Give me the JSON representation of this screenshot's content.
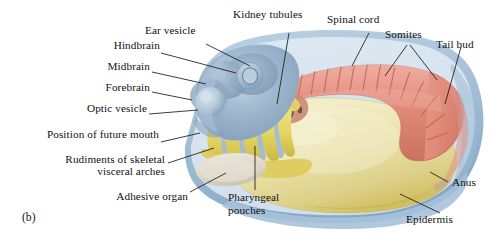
{
  "figure": {
    "panel_label": "(b)",
    "background": "#ffffff"
  },
  "palette": {
    "brain": "#8fa8c0",
    "brain_deep": "#6d8aa6",
    "brain_light": "#bcd0e0",
    "epidermis_rim": "#9dbad4",
    "neural_cord": "#e0897a",
    "neural_cord_dark": "#c4705f",
    "somite_line": "#b9604f",
    "yolk_pale": "#ece4b0",
    "yolk_deep": "#d4c35e",
    "arch_yellow": "#e8d96a",
    "arch_yellow_deep": "#cdb94a",
    "pouch_blue": "#9fb9d2",
    "kidney_brown": "#7a5441",
    "adhesive_organ": "#ddd8cc",
    "leader": "#1a1a1a",
    "text": "#111111"
  },
  "labels": {
    "ear_vesicle": "Ear vesicle",
    "hindbrain": "Hindbrain",
    "midbrain": "Midbrain",
    "forebrain": "Forebrain",
    "optic_vesicle": "Optic vesicle",
    "position_of_future_mouth": "Position of future mouth",
    "rudiments_line1": "Rudiments of skeletal",
    "rudiments_line2": "visceral arches",
    "adhesive_organ": "Adhesive organ",
    "pharyngeal_line1": "Pharyngeal",
    "pharyngeal_line2": "pouches",
    "kidney_tubules": "Kidney tubules",
    "spinal_cord": "Spinal cord",
    "somites": "Somites",
    "tail_bud": "Tail bud",
    "anus": "Anus",
    "epidermis": "Epidermis"
  }
}
